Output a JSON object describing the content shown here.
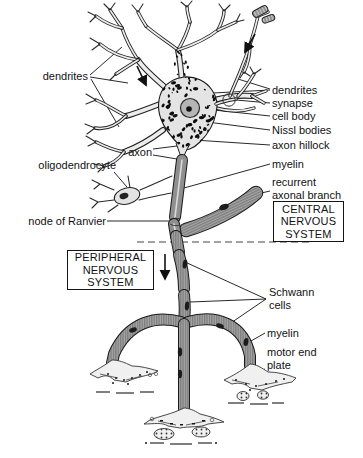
{
  "labels": {
    "dendrites_left": "dendrites",
    "dendrites_right": "dendrites",
    "synapse": "synapse",
    "cell_body": "cell body",
    "nissl_bodies": "Nissl bodies",
    "axon_hillock": "axon hillock",
    "axon": "axon",
    "oligodendrocyte": "oligodendrocyte",
    "myelin_upper": "myelin",
    "recurrent_axonal_branch": "recurrent\naxonal branch",
    "central_nervous_system": "CENTRAL\nNERVOUS\nSYSTEM",
    "node_of_ranvier": "node of Ranvier",
    "peripheral_nervous_system": "PERIPHERAL\nNERVOUS\nSYSTEM",
    "schwann_cells": "Schwann\ncells",
    "myelin_lower": "myelin",
    "motor_end_plate": "motor end\nplate"
  },
  "colors": {
    "ink": "#1a1a1a",
    "myelin_gray": "#8f8f8f",
    "sheath_gray": "#a6a6a6",
    "cell_fill": "#e4e4e4",
    "background": "#ffffff"
  }
}
